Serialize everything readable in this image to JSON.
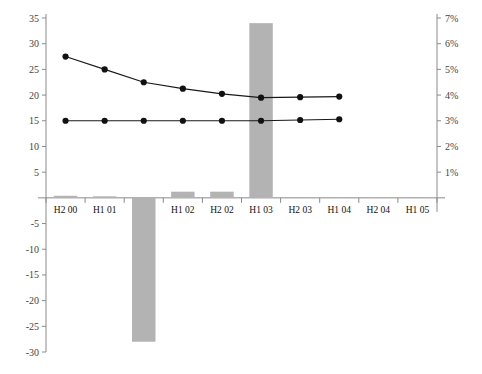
{
  "chart_data": {
    "type": "bar",
    "title": "",
    "subtitle": "",
    "xlabel": "",
    "ylabel": "",
    "y2label": "",
    "grid": false,
    "legend": "none",
    "categories": [
      "H2 00",
      "H1 01",
      "H2 01",
      "H1 02",
      "H2 02",
      "H1 03",
      "H2 03",
      "H1 04",
      "H2 04",
      "H1 05"
    ],
    "ylim": [
      -30,
      35
    ],
    "yticks": [
      35,
      30,
      25,
      20,
      15,
      10,
      5,
      -5,
      -10,
      -15,
      -20,
      -25,
      -30
    ],
    "ytick_labels": [
      "35",
      "30",
      "25",
      "20",
      "15",
      "10",
      "5",
      "-5",
      "-10",
      "-15",
      "-20",
      "-25",
      "-30"
    ],
    "y2lim": [
      0,
      7
    ],
    "y2ticks": [
      7,
      6,
      5,
      4,
      3,
      2,
      1
    ],
    "y2tick_labels": [
      "7%",
      "6%",
      "5%",
      "4%",
      "3%",
      "2%",
      "1%"
    ],
    "series": [
      {
        "name": "bars",
        "type": "bar",
        "axis": "left",
        "color": "#b3b3b3",
        "values": [
          0.4,
          0.3,
          -28.0,
          1.2,
          1.2,
          34.0,
          null,
          null,
          null,
          null
        ]
      },
      {
        "name": "upper-line",
        "type": "line",
        "axis": "right",
        "color": "#111111",
        "values": [
          5.5,
          5.0,
          4.5,
          4.25,
          4.05,
          3.9,
          3.92,
          3.94,
          null,
          null
        ]
      },
      {
        "name": "lower-line",
        "type": "line",
        "axis": "right",
        "color": "#111111",
        "values": [
          3.0,
          3.0,
          3.0,
          3.0,
          3.0,
          3.0,
          3.03,
          3.06,
          null,
          null
        ]
      }
    ]
  }
}
